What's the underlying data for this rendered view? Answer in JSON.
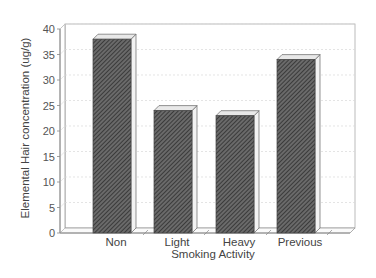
{
  "chart_data": {
    "type": "bar",
    "style": "3d-hatched",
    "title": "",
    "xlabel": "Smoking Activity",
    "ylabel": "Elemental Hair concentration (ug/g)",
    "categories": [
      "Non",
      "Light",
      "Heavy",
      "Previous"
    ],
    "values": [
      38,
      24,
      23,
      34
    ],
    "ylim": [
      0,
      40
    ],
    "yticks": [
      0,
      5,
      10,
      15,
      20,
      25,
      30,
      35,
      40
    ],
    "grid": true,
    "legend": null
  },
  "colors": {
    "bar_fill": "#5a5a5a",
    "bar_hatch": "#2a2a2a",
    "bar_top": "#e8e8e8",
    "bar_side": "#f2f2f2",
    "axis": "#888888",
    "grid": "#d8d8d8"
  }
}
